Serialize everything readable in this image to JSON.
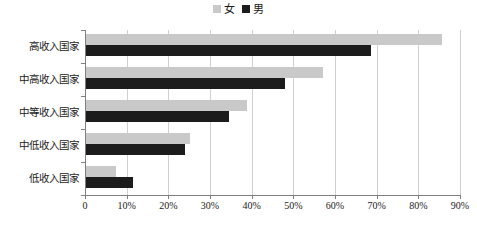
{
  "chart_data": {
    "type": "bar",
    "orientation": "horizontal",
    "title": "",
    "xlabel": "",
    "ylabel": "",
    "categories": [
      "高收入国家",
      "中高收入国家",
      "中等收入国家",
      "中低收入国家",
      "低收入国家"
    ],
    "series": [
      {
        "name": "女",
        "color": "#c9c9c9",
        "values": [
          85.7,
          57.1,
          38.8,
          25.2,
          7.4
        ]
      },
      {
        "name": "男",
        "color": "#1c1c1c",
        "values": [
          68.6,
          48.0,
          34.6,
          24.0,
          11.5
        ]
      }
    ],
    "xlim": [
      0,
      90
    ],
    "xtick_labels": [
      "0",
      "10%",
      "20%",
      "30%",
      "40%",
      "50%",
      "60%",
      "70%",
      "80%",
      "90%"
    ],
    "xtick_values": [
      0,
      10,
      20,
      30,
      40,
      50,
      60,
      70,
      80,
      90
    ],
    "grid": true,
    "grid_axis": "x",
    "legend_position": "top-center",
    "legend": [
      {
        "label": "女",
        "color": "#c9c9c9"
      },
      {
        "label": "男",
        "color": "#1c1c1c"
      }
    ]
  },
  "caption": {
    "text": ""
  },
  "colors": {
    "female": "#c9c9c9",
    "male": "#1c1c1c",
    "axis": "#7f7f7f",
    "grid": "#d0d0d0",
    "background": "#ffffff"
  }
}
